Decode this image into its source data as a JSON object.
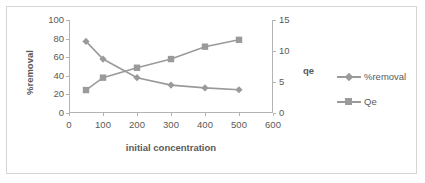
{
  "chart_data": {
    "type": "line",
    "title": "",
    "xlabel": "initial concentration",
    "ylabel": "%removal",
    "y2label": "qe",
    "x": [
      50,
      100,
      200,
      300,
      400,
      500
    ],
    "xlim": [
      0,
      600
    ],
    "xticks": [
      "0",
      "100",
      "200",
      "300",
      "400",
      "500",
      "600"
    ],
    "ylim": [
      0,
      100
    ],
    "yticks": [
      "0",
      "20",
      "40",
      "60",
      "80",
      "100"
    ],
    "y2lim": [
      0,
      15
    ],
    "y2ticks": [
      "0",
      "5",
      "10",
      "15"
    ],
    "grid": false,
    "legend_position": "right",
    "series": [
      {
        "name": "%removal",
        "axis": "left",
        "marker": "diamond",
        "color": "#9a9a9a",
        "values": [
          77,
          58,
          38,
          30,
          27,
          25
        ]
      },
      {
        "name": "Qe",
        "axis": "right",
        "marker": "square",
        "color": "#9a9a9a",
        "values": [
          3.7,
          5.7,
          7.3,
          8.7,
          10.7,
          11.8
        ]
      }
    ]
  },
  "axes": {
    "left_title": "%removal",
    "right_title": "qe",
    "x_title": "initial concentration"
  },
  "legend": {
    "items": [
      {
        "label": "%removal",
        "marker": "diamond"
      },
      {
        "label": "Qe",
        "marker": "square"
      }
    ]
  },
  "colors": {
    "series": "#9a9a9a",
    "axis": "#b3b3b3",
    "text": "#5a5a5a",
    "border": "#d4d4d4"
  }
}
